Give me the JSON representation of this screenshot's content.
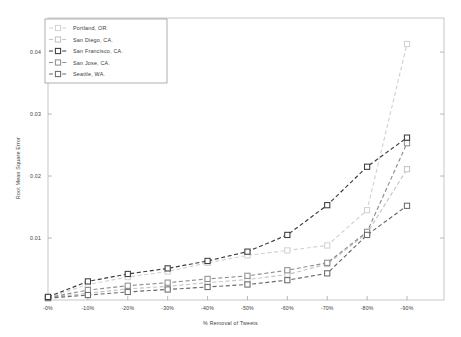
{
  "chart_data": {
    "type": "line",
    "title": "",
    "xlabel": "% Removal of Tweets",
    "ylabel": "Root Mean Square Error",
    "categories": [
      "-0%",
      "-10%",
      "-20%",
      "-30%",
      "-40%",
      "-50%",
      "-60%",
      "-70%",
      "-80%",
      "-90%"
    ],
    "x_tick_labels": [
      "-0%",
      "-10%",
      "-20%",
      "-30%",
      "-40%",
      "-50%",
      "-60%",
      "-70%",
      "-80%",
      "-90%"
    ],
    "y_tick_labels": [
      "0.01",
      "0.02",
      "0.03",
      "0.04"
    ],
    "y_ticks": [
      0.01,
      0.02,
      0.03,
      0.04
    ],
    "ylim": [
      0,
      0.0455
    ],
    "xlim": [
      -0.5,
      9.5
    ],
    "grid": false,
    "legend_position": "upper-left",
    "marker": "square",
    "linestyle": "dashed",
    "series": [
      {
        "name": "Portland, OR.",
        "color": "#d2d2d2",
        "values": [
          0.0004,
          0.0025,
          0.0037,
          0.0046,
          0.006,
          0.0072,
          0.008,
          0.0088,
          0.0145,
          0.0413
        ]
      },
      {
        "name": "San Diego, CA.",
        "color": "#c4c4c4",
        "values": [
          0.0004,
          0.0011,
          0.0018,
          0.0022,
          0.0028,
          0.0033,
          0.0041,
          0.0058,
          0.0108,
          0.0211
        ]
      },
      {
        "name": "San Francisco, CA.",
        "color": "#3c3c3c",
        "values": [
          0.0005,
          0.003,
          0.0042,
          0.0051,
          0.0063,
          0.0078,
          0.0105,
          0.0153,
          0.0215,
          0.0262
        ]
      },
      {
        "name": "San Jose, CA.",
        "color": "#8f8f8f",
        "values": [
          0.0004,
          0.0016,
          0.0023,
          0.0028,
          0.0034,
          0.0039,
          0.0048,
          0.006,
          0.011,
          0.0253
        ]
      },
      {
        "name": "Seattle, WA.",
        "color": "#6a6a6a",
        "values": [
          0.0003,
          0.0008,
          0.0013,
          0.0017,
          0.0021,
          0.0025,
          0.0032,
          0.0043,
          0.0105,
          0.0152
        ]
      }
    ]
  },
  "legend": {
    "entries": [
      "Portland, OR.",
      "San Diego, CA.",
      "San Francisco, CA.",
      "San Jose, CA.",
      "Seattle, WA."
    ]
  }
}
